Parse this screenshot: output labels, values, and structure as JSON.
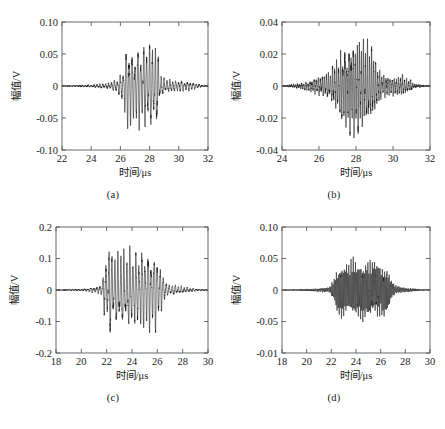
{
  "figure": {
    "panels": [
      "a",
      "b",
      "c",
      "d"
    ],
    "shared_xlabel": "时间/μs",
    "shared_ylabel": "幅值/V"
  },
  "ghost_text": {
    "top": "",
    "bottom": ""
  },
  "chart_data": [
    {
      "id": "a",
      "type": "line",
      "title": "",
      "caption": "(a)",
      "xlabel": "时间/μs",
      "ylabel": "幅值/V",
      "xlim": [
        22,
        32
      ],
      "ylim": [
        -0.1,
        0.1
      ],
      "xticks": [
        22,
        24,
        26,
        28,
        30,
        32
      ],
      "xticklabels": [
        "22",
        "24",
        "26",
        "28",
        "30",
        "32"
      ],
      "yticks": [
        -0.1,
        -0.05,
        0,
        0.05,
        0.1
      ],
      "yticklabels": [
        "-0.10",
        "-0.05",
        "0",
        "0.05",
        "0.10"
      ],
      "grid": false,
      "legend": null,
      "signal": {
        "description": "ultrasonic echo burst, asymmetric envelope with trailing ripple",
        "carrier_freq_MHz": 5.0,
        "noise_level": 0.0022,
        "envelope_segments": [
          {
            "t": 22.0,
            "amp": 0.0
          },
          {
            "t": 23.2,
            "amp": 0.001
          },
          {
            "t": 25.0,
            "amp": 0.004
          },
          {
            "t": 25.8,
            "amp": 0.011
          },
          {
            "t": 26.2,
            "amp": 0.03
          },
          {
            "t": 26.5,
            "amp": 0.082
          },
          {
            "t": 26.9,
            "amp": 0.06
          },
          {
            "t": 27.3,
            "amp": 0.072
          },
          {
            "t": 27.7,
            "amp": 0.07
          },
          {
            "t": 28.1,
            "amp": 0.075
          },
          {
            "t": 28.5,
            "amp": 0.068
          },
          {
            "t": 28.75,
            "amp": 0.02
          },
          {
            "t": 29.1,
            "amp": 0.012
          },
          {
            "t": 29.8,
            "amp": 0.01
          },
          {
            "t": 30.6,
            "amp": 0.008
          },
          {
            "t": 31.3,
            "amp": 0.004
          },
          {
            "t": 31.6,
            "amp": 0.001
          },
          {
            "t": 32.0,
            "amp": 0.0
          }
        ],
        "peak_positive": 0.082,
        "peak_negative": -0.078
      }
    },
    {
      "id": "b",
      "type": "line",
      "title": "",
      "caption": "(b)",
      "xlabel": "时间/μs",
      "ylabel": "幅值/V",
      "xlim": [
        24,
        32
      ],
      "ylim": [
        -0.04,
        0.04
      ],
      "xticks": [
        24,
        26,
        28,
        30,
        32
      ],
      "xticklabels": [
        "24",
        "26",
        "28",
        "30",
        "32"
      ],
      "yticks": [
        -0.04,
        -0.02,
        0,
        0.02,
        0.04
      ],
      "yticklabels": [
        "-0.04",
        "-0.02",
        "0",
        "0.02",
        "0.04"
      ],
      "grid": false,
      "legend": null,
      "signal": {
        "description": "dense symmetric spindle-shaped burst with small side lobes",
        "carrier_freq_MHz": 9.0,
        "noise_level": 0.0012,
        "envelope_segments": [
          {
            "t": 24.0,
            "amp": 0.0
          },
          {
            "t": 24.8,
            "amp": 0.0012
          },
          {
            "t": 25.4,
            "amp": 0.003
          },
          {
            "t": 26.0,
            "amp": 0.006
          },
          {
            "t": 26.5,
            "amp": 0.009
          },
          {
            "t": 26.9,
            "amp": 0.016
          },
          {
            "t": 27.3,
            "amp": 0.026
          },
          {
            "t": 27.8,
            "amp": 0.031
          },
          {
            "t": 28.2,
            "amp": 0.032
          },
          {
            "t": 28.6,
            "amp": 0.03
          },
          {
            "t": 28.9,
            "amp": 0.024
          },
          {
            "t": 29.2,
            "amp": 0.012
          },
          {
            "t": 29.5,
            "amp": 0.008
          },
          {
            "t": 30.0,
            "amp": 0.006
          },
          {
            "t": 30.5,
            "amp": 0.007
          },
          {
            "t": 30.9,
            "amp": 0.004
          },
          {
            "t": 31.2,
            "amp": 0.001
          },
          {
            "t": 32.0,
            "amp": 0.0
          }
        ],
        "peak_positive": 0.032,
        "peak_negative": -0.034
      }
    },
    {
      "id": "c",
      "type": "line",
      "title": "",
      "caption": "(c)",
      "xlabel": "时间/μs",
      "ylabel": "幅值/V",
      "xlim": [
        18,
        30
      ],
      "ylim": [
        -0.2,
        0.2
      ],
      "xticks": [
        18,
        20,
        22,
        24,
        26,
        28,
        30
      ],
      "xticklabels": [
        "18",
        "20",
        "22",
        "24",
        "26",
        "28",
        "30"
      ],
      "yticks": [
        -0.2,
        -0.1,
        0,
        0.1,
        0.2
      ],
      "yticklabels": [
        "-0.2",
        "-0.1",
        "0",
        "0.1",
        "0.2"
      ],
      "grid": false,
      "legend": null,
      "signal": {
        "description": "flat-topped high amplitude burst with abrupt onset and trailing tail",
        "carrier_freq_MHz": 4.2,
        "noise_level": 0.004,
        "envelope_segments": [
          {
            "t": 18.0,
            "amp": 0.0
          },
          {
            "t": 19.9,
            "amp": 0.002
          },
          {
            "t": 21.2,
            "amp": 0.01
          },
          {
            "t": 21.6,
            "amp": 0.022
          },
          {
            "t": 21.9,
            "amp": 0.11
          },
          {
            "t": 22.2,
            "amp": 0.155
          },
          {
            "t": 22.6,
            "amp": 0.12
          },
          {
            "t": 23.0,
            "amp": 0.14
          },
          {
            "t": 23.4,
            "amp": 0.135
          },
          {
            "t": 23.9,
            "amp": 0.142
          },
          {
            "t": 24.4,
            "amp": 0.13
          },
          {
            "t": 24.9,
            "amp": 0.145
          },
          {
            "t": 25.4,
            "amp": 0.138
          },
          {
            "t": 25.9,
            "amp": 0.135
          },
          {
            "t": 26.2,
            "amp": 0.09
          },
          {
            "t": 26.45,
            "amp": 0.055
          },
          {
            "t": 26.8,
            "amp": 0.02
          },
          {
            "t": 27.3,
            "amp": 0.018
          },
          {
            "t": 27.9,
            "amp": 0.012
          },
          {
            "t": 28.6,
            "amp": 0.006
          },
          {
            "t": 29.4,
            "amp": 0.002
          },
          {
            "t": 30.0,
            "amp": 0.0
          }
        ],
        "peak_positive": 0.157,
        "peak_negative": -0.15
      }
    },
    {
      "id": "d",
      "type": "line",
      "title": "",
      "caption": "(d)",
      "xlabel": "时间/μs",
      "ylabel": "幅值/V",
      "xlim": [
        18,
        30
      ],
      "ylim": [
        -0.01,
        0.1
      ],
      "yaxis_note": "lower tick labelled -0.01 as printed; plotted range symmetric about 0",
      "xticks": [
        18,
        20,
        22,
        24,
        26,
        28,
        30
      ],
      "xticklabels": [
        "18",
        "20",
        "22",
        "24",
        "26",
        "28",
        "30"
      ],
      "yticks": [
        -0.1,
        -0.05,
        0,
        0.05,
        0.1
      ],
      "yticklabels": [
        "-0.01",
        "-0.05",
        "0",
        "0.05",
        "0.10"
      ],
      "grid": false,
      "legend": null,
      "signal": {
        "description": "dense flat-topped burst, very high carrier density, small trailing ripple",
        "carrier_freq_MHz": 11.0,
        "noise_level": 0.0016,
        "envelope_segments": [
          {
            "t": 18.0,
            "amp": 0.0
          },
          {
            "t": 20.0,
            "amp": 0.0015
          },
          {
            "t": 21.8,
            "amp": 0.004
          },
          {
            "t": 22.2,
            "amp": 0.018
          },
          {
            "t": 22.5,
            "amp": 0.042
          },
          {
            "t": 22.9,
            "amp": 0.048
          },
          {
            "t": 23.3,
            "amp": 0.045
          },
          {
            "t": 23.8,
            "amp": 0.05
          },
          {
            "t": 24.3,
            "amp": 0.047
          },
          {
            "t": 24.8,
            "amp": 0.05
          },
          {
            "t": 25.3,
            "amp": 0.046
          },
          {
            "t": 25.8,
            "amp": 0.049
          },
          {
            "t": 26.2,
            "amp": 0.045
          },
          {
            "t": 26.6,
            "amp": 0.038
          },
          {
            "t": 26.9,
            "amp": 0.014
          },
          {
            "t": 27.2,
            "amp": 0.008
          },
          {
            "t": 27.6,
            "amp": 0.005
          },
          {
            "t": 28.2,
            "amp": 0.003
          },
          {
            "t": 29.0,
            "amp": 0.0015
          },
          {
            "t": 30.0,
            "amp": 0.0
          }
        ],
        "peak_positive": 0.051,
        "peak_negative": -0.052
      }
    }
  ]
}
